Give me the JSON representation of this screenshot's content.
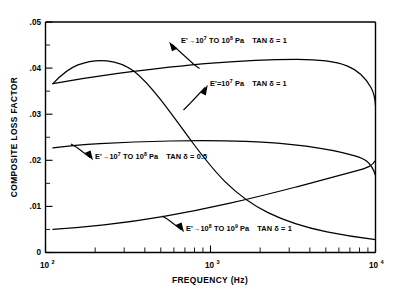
{
  "chart_data": {
    "type": "line",
    "title": "",
    "xlabel": "FREQUENCY (Hz)",
    "ylabel": "COMPOSITE LOSS FACTOR",
    "xscale": "log",
    "xlim": [
      100,
      10000
    ],
    "ylim": [
      0,
      0.05
    ],
    "grid": false,
    "legend_position": "inline-annotations",
    "x_tick_labels": [
      "10²",
      "10³",
      "10⁴"
    ],
    "x_tick_values": [
      100,
      1000,
      10000
    ],
    "y_tick_labels": [
      "0",
      ".01",
      ".02",
      ".03",
      ".04",
      ".05"
    ],
    "y_tick_values": [
      0,
      0.01,
      0.02,
      0.03,
      0.04,
      0.05
    ],
    "y_minor_tick_values": [
      0.005,
      0.015,
      0.025,
      0.035,
      0.045
    ],
    "series": [
      {
        "name": "E'→10⁷ TO 10⁸ Pa   TAN δ = 1",
        "label_html": "E'→10<sup>7</sup> TO 10<sup>8</sup> Pa<span class=\"gap-lg\"></span>TAN δ = 1",
        "x": [
          130,
          160,
          200,
          260,
          330,
          420,
          540,
          700,
          900,
          1200,
          1500,
          2000,
          2600,
          3400,
          4400,
          5800,
          7500,
          10000
        ],
        "values": [
          0.0366,
          0.0372,
          0.0379,
          0.0386,
          0.0392,
          0.0398,
          0.0403,
          0.0409,
          0.0413,
          0.0417,
          0.0418,
          0.0417,
          0.0412,
          0.0403,
          0.0389,
          0.037,
          0.0346,
          0.0318
        ]
      },
      {
        "name": "E'=10⁷ Pa   TAN δ = 1",
        "label_html": "E'=10<sup>7</sup> Pa<span class=\"gap-lg\"></span>TAN δ = 1",
        "x": [
          130,
          160,
          200,
          250,
          300,
          360,
          430,
          520,
          640,
          800,
          1000,
          1300,
          1700,
          2200,
          2900,
          3800,
          5000,
          6500,
          8000,
          10000
        ],
        "values": [
          0.0366,
          0.0399,
          0.0418,
          0.0423,
          0.0419,
          0.0406,
          0.0386,
          0.0358,
          0.0322,
          0.028,
          0.0236,
          0.0189,
          0.0146,
          0.011,
          0.0083,
          0.0065,
          0.0053,
          0.0046,
          0.0043,
          0.004
        ]
      },
      {
        "name": "E'→10⁷ TO 10⁸ Pa   TAN δ = 0.5",
        "label_html": "E'→10<sup>7</sup> TO 10<sup>8</sup> Pa<span class=\"gap-lg\"></span>TAN δ = 0.5",
        "x": [
          130,
          170,
          220,
          290,
          380,
          500,
          650,
          850,
          1100,
          1450,
          1900,
          2500,
          3300,
          4300,
          5600,
          7300,
          10000
        ],
        "values": [
          0.0227,
          0.0231,
          0.0234,
          0.0237,
          0.0239,
          0.024,
          0.0241,
          0.0241,
          0.024,
          0.0238,
          0.0234,
          0.0228,
          0.022,
          0.0209,
          0.0196,
          0.0182,
          0.0165
        ]
      },
      {
        "name": "E'→10⁸ TO 10⁹ Pa   TAN δ = 1",
        "label_html": "E'→10<sup>8</sup> TO 10<sup>9</sup> Pa<span class=\"gap-lg\"></span>TAN δ = 1",
        "x": [
          130,
          170,
          220,
          290,
          380,
          500,
          650,
          850,
          1100,
          1450,
          1900,
          2500,
          3300,
          4300,
          5600,
          7300,
          10000
        ],
        "values": [
          0.005,
          0.0053,
          0.0057,
          0.0062,
          0.0068,
          0.0075,
          0.0083,
          0.0092,
          0.0102,
          0.0113,
          0.0125,
          0.0139,
          0.0153,
          0.0167,
          0.018,
          0.0192,
          0.0202
        ]
      }
    ],
    "annotations": [
      {
        "text": "E'→10⁷ TO 10⁸ Pa   TAN δ = 1",
        "target_series": 0,
        "arrow_from": [
          180,
          44
        ],
        "arrow_to": [
          205,
          69
        ]
      },
      {
        "text": "E'=10⁷ Pa   TAN δ = 1",
        "target_series": 1,
        "arrow_from": [
          207,
          88
        ],
        "arrow_to": [
          186,
          110
        ]
      },
      {
        "text": "E'→10⁷ TO 10⁸ Pa   TAN δ = 0.5",
        "target_series": 2,
        "arrow_from": [
          92,
          158
        ],
        "arrow_to": [
          73,
          146
        ]
      },
      {
        "text": "E'→10⁸ TO 10⁹ Pa   TAN δ = 1",
        "target_series": 3,
        "arrow_from": [
          183,
          230
        ],
        "arrow_to": [
          163,
          218
        ]
      }
    ]
  },
  "axes": {
    "x_title": "FREQUENCY (Hz)",
    "y_title": "COMPOSITE LOSS FACTOR",
    "x_labels": [
      {
        "mantissa": "10",
        "exponent": "2"
      },
      {
        "mantissa": "10",
        "exponent": "3"
      },
      {
        "mantissa": "10",
        "exponent": "4"
      }
    ],
    "y_labels": [
      "0",
      ".01",
      ".02",
      ".03",
      ".04",
      ".05"
    ]
  }
}
